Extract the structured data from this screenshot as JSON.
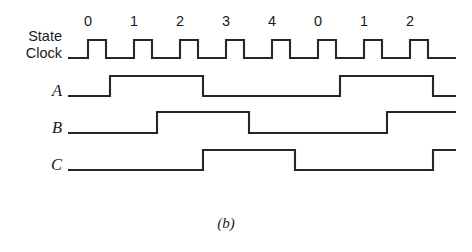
{
  "figure": {
    "caption": "(b)",
    "background_color": "#ffffff",
    "line_color": "#262626"
  },
  "axis": {
    "state_labels": [
      "0",
      "1",
      "2",
      "3",
      "4",
      "0",
      "1",
      "2"
    ],
    "state_label_x": [
      88,
      134,
      180,
      226,
      272,
      318,
      364,
      410
    ],
    "state_label_y": 26
  },
  "rows": [
    {
      "name": "state-clock",
      "label_lines": [
        "State",
        "Clock"
      ],
      "label_style": "sans",
      "label_x": 62,
      "label_y": [
        41,
        58
      ],
      "y_high": 40,
      "y_low": 58,
      "x_start": 68,
      "x_end": 456
    },
    {
      "name": "signal-a",
      "label_lines": [
        "A"
      ],
      "label_style": "italic",
      "label_x": 62,
      "label_y": [
        96
      ],
      "y_high": 76,
      "y_low": 96,
      "x_start": 68,
      "x_end": 456
    },
    {
      "name": "signal-b",
      "label_lines": [
        "B"
      ],
      "label_style": "italic",
      "label_x": 62,
      "label_y": [
        133
      ],
      "y_high": 112,
      "y_low": 133,
      "x_start": 68,
      "x_end": 456
    },
    {
      "name": "signal-c",
      "label_lines": [
        "C"
      ],
      "label_style": "italic",
      "label_x": 62,
      "label_y": [
        170
      ],
      "y_high": 150,
      "y_low": 170,
      "x_start": 68,
      "x_end": 456
    }
  ],
  "caption_pos": {
    "x": 226,
    "y": 228
  },
  "chart_data": {
    "type": "line",
    "title": "(b)",
    "xlabel": "",
    "ylabel": "",
    "signals": [
      "State Clock",
      "A",
      "B",
      "C"
    ],
    "state_sequence": [
      "0",
      "1",
      "2",
      "3",
      "4",
      "0",
      "1",
      "2"
    ],
    "clock_period_px": 46,
    "clock_pulse_width_px": 18,
    "clock_first_rise_px": 88,
    "levels": {
      "State Clock": [
        0,
        1,
        0,
        1,
        0,
        1,
        0,
        1,
        0,
        1,
        0,
        1,
        0,
        1,
        0,
        1,
        0
      ],
      "A": [
        0,
        1,
        1,
        0,
        0,
        0,
        1,
        1,
        0
      ],
      "B": [
        0,
        0,
        1,
        1,
        0,
        0,
        0,
        1,
        1
      ],
      "C": [
        0,
        0,
        0,
        1,
        1,
        0,
        0,
        0,
        1
      ]
    },
    "transitions": {
      "State Clock": [
        {
          "x": 88,
          "edge": "rise"
        },
        {
          "x": 106,
          "edge": "fall"
        },
        {
          "x": 134,
          "edge": "rise"
        },
        {
          "x": 152,
          "edge": "fall"
        },
        {
          "x": 180,
          "edge": "rise"
        },
        {
          "x": 198,
          "edge": "fall"
        },
        {
          "x": 226,
          "edge": "rise"
        },
        {
          "x": 244,
          "edge": "fall"
        },
        {
          "x": 272,
          "edge": "rise"
        },
        {
          "x": 290,
          "edge": "fall"
        },
        {
          "x": 318,
          "edge": "rise"
        },
        {
          "x": 336,
          "edge": "fall"
        },
        {
          "x": 364,
          "edge": "rise"
        },
        {
          "x": 382,
          "edge": "fall"
        },
        {
          "x": 410,
          "edge": "rise"
        },
        {
          "x": 428,
          "edge": "fall"
        }
      ],
      "A": [
        {
          "x": 110,
          "edge": "rise"
        },
        {
          "x": 203,
          "edge": "fall"
        },
        {
          "x": 340,
          "edge": "rise"
        },
        {
          "x": 433,
          "edge": "fall"
        }
      ],
      "B": [
        {
          "x": 157,
          "edge": "rise"
        },
        {
          "x": 249,
          "edge": "fall"
        },
        {
          "x": 387,
          "edge": "rise"
        }
      ],
      "C": [
        {
          "x": 203,
          "edge": "rise"
        },
        {
          "x": 295,
          "edge": "fall"
        },
        {
          "x": 433,
          "edge": "rise"
        }
      ]
    }
  }
}
